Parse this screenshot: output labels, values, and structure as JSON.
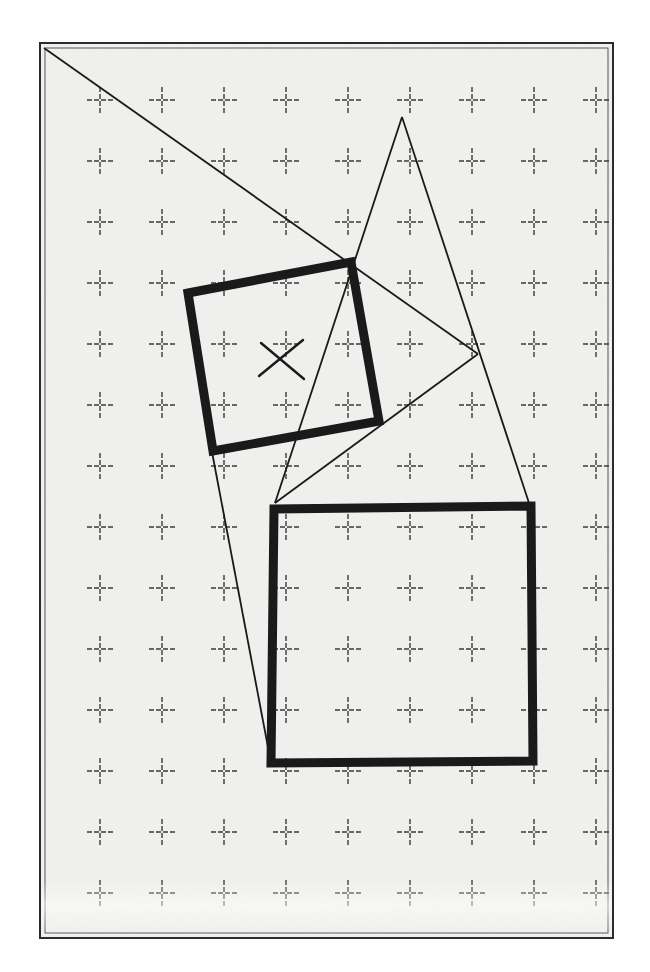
{
  "figure": {
    "canvas": {
      "width": 650,
      "height": 972
    },
    "colors": {
      "page_background": "#ffffff",
      "panel_background": "#f1f1ef",
      "ink": "#1a1a1a",
      "grid_ink": "#3a3a3a",
      "frame_ink": "#2b2b2b"
    },
    "panel": {
      "name": "drawing-panel",
      "x": 40,
      "y": 43,
      "width": 573,
      "height": 895,
      "outer_border_width": 2,
      "inner_border_inset": 5,
      "inner_border_width": 1
    },
    "grid": {
      "type": "cross-tick-grid",
      "origin_x": 100,
      "origin_y": 100,
      "spacing_x": 62,
      "spacing_y": 61,
      "columns": 9,
      "rows": 14,
      "arm_length": 13,
      "stroke_width": 1.4,
      "dash": "5 2"
    },
    "shapes": [
      {
        "name": "rotated-square-small",
        "kind": "polygon",
        "stroke_width": 9,
        "filled": false,
        "points": [
          [
            188,
            293
          ],
          [
            351,
            262
          ],
          [
            379,
            421
          ],
          [
            213,
            451
          ]
        ]
      },
      {
        "name": "large-square-lower",
        "kind": "polygon",
        "stroke_width": 9,
        "filled": false,
        "points": [
          [
            274,
            509
          ],
          [
            531,
            506
          ],
          [
            533,
            761
          ],
          [
            271,
            763
          ]
        ]
      },
      {
        "name": "center-cross-mark",
        "kind": "x-mark",
        "stroke_width": 2.4,
        "segments": [
          [
            [
              261,
              343
            ],
            [
              304,
              379
            ]
          ],
          [
            [
              259,
              376
            ],
            [
              303,
              340
            ]
          ]
        ]
      },
      {
        "name": "construction-line-top-diagonal",
        "kind": "line",
        "stroke_width": 1.8,
        "points": [
          [
            44,
            48
          ],
          [
            478,
            354
          ]
        ]
      },
      {
        "name": "construction-triangle-left-edge",
        "kind": "line",
        "stroke_width": 1.8,
        "points": [
          [
            402,
            117
          ],
          [
            275,
            503
          ]
        ]
      },
      {
        "name": "construction-triangle-right-edge",
        "kind": "line",
        "stroke_width": 1.8,
        "points": [
          [
            402,
            117
          ],
          [
            529,
            503
          ]
        ]
      },
      {
        "name": "construction-line-vertex-to-base",
        "kind": "line",
        "stroke_width": 1.8,
        "points": [
          [
            478,
            354
          ],
          [
            275,
            503
          ]
        ]
      },
      {
        "name": "construction-line-left-long",
        "kind": "line",
        "stroke_width": 1.8,
        "points": [
          [
            212,
            452
          ],
          [
            271,
            763
          ]
        ]
      }
    ],
    "texture": {
      "fade_band_top": 880,
      "fade_band_height": 56,
      "noise_opacity": 0.05
    }
  }
}
